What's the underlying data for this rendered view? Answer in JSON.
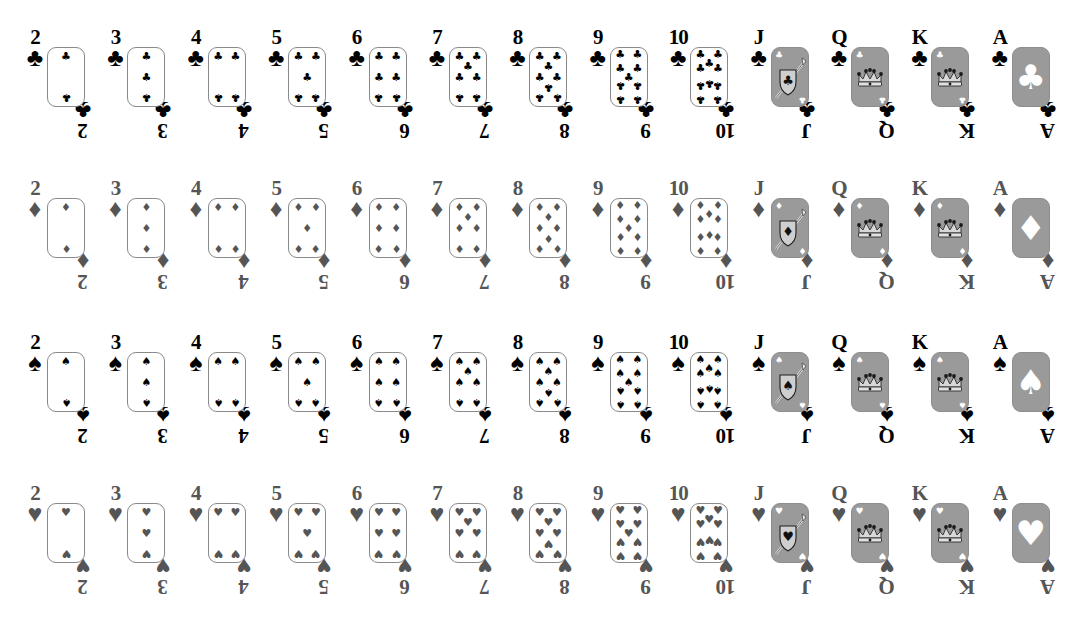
{
  "page": {
    "background": "#ffffff",
    "width": 1092,
    "height": 631
  },
  "palette": {
    "dark_suit": "#000000",
    "light_suit": "#555555",
    "card_outline": "#8a8a8a",
    "face_card_fill": "#9a9a9a",
    "card_face_white": "#ffffff"
  },
  "ranks": [
    {
      "label": "2",
      "value": 2,
      "kind": "number"
    },
    {
      "label": "3",
      "value": 3,
      "kind": "number"
    },
    {
      "label": "4",
      "value": 4,
      "kind": "number"
    },
    {
      "label": "5",
      "value": 5,
      "kind": "number"
    },
    {
      "label": "6",
      "value": 6,
      "kind": "number"
    },
    {
      "label": "7",
      "value": 7,
      "kind": "number"
    },
    {
      "label": "8",
      "value": 8,
      "kind": "number"
    },
    {
      "label": "9",
      "value": 9,
      "kind": "number"
    },
    {
      "label": "10",
      "value": 10,
      "kind": "number"
    },
    {
      "label": "J",
      "value": 11,
      "kind": "jack"
    },
    {
      "label": "Q",
      "value": 12,
      "kind": "queen"
    },
    {
      "label": "K",
      "value": 13,
      "kind": "king"
    },
    {
      "label": "A",
      "value": 1,
      "kind": "ace"
    }
  ],
  "suits": [
    {
      "name": "clubs",
      "glyph": "♣",
      "color": "#000000",
      "tone": "dark",
      "row": 0,
      "top": 25
    },
    {
      "name": "diamonds",
      "glyph": "♦",
      "color": "#555555",
      "tone": "gray",
      "row": 1,
      "top": 176
    },
    {
      "name": "spades",
      "glyph": "♠",
      "color": "#000000",
      "tone": "dark",
      "row": 2,
      "top": 330
    },
    {
      "name": "hearts",
      "glyph": "♥",
      "color": "#555555",
      "tone": "gray",
      "row": 3,
      "top": 481
    }
  ],
  "layout": {
    "column_start_x": 18,
    "column_step_x": 80.4,
    "card_body_width": 38,
    "card_body_height": 60
  },
  "pip_layouts": {
    "2": [
      [
        50,
        14
      ],
      [
        50,
        86
      ]
    ],
    "3": [
      [
        50,
        14
      ],
      [
        50,
        50
      ],
      [
        50,
        86
      ]
    ],
    "4": [
      [
        26,
        14
      ],
      [
        74,
        14
      ],
      [
        26,
        86
      ],
      [
        74,
        86
      ]
    ],
    "5": [
      [
        26,
        14
      ],
      [
        74,
        14
      ],
      [
        50,
        50
      ],
      [
        26,
        86
      ],
      [
        74,
        86
      ]
    ],
    "6": [
      [
        26,
        14
      ],
      [
        74,
        14
      ],
      [
        26,
        50
      ],
      [
        74,
        50
      ],
      [
        26,
        86
      ],
      [
        74,
        86
      ]
    ],
    "7": [
      [
        26,
        14
      ],
      [
        74,
        14
      ],
      [
        50,
        32
      ],
      [
        26,
        50
      ],
      [
        74,
        50
      ],
      [
        26,
        86
      ],
      [
        74,
        86
      ]
    ],
    "8": [
      [
        26,
        14
      ],
      [
        74,
        14
      ],
      [
        50,
        32
      ],
      [
        26,
        50
      ],
      [
        74,
        50
      ],
      [
        50,
        68
      ],
      [
        26,
        86
      ],
      [
        74,
        86
      ]
    ],
    "9": [
      [
        26,
        12
      ],
      [
        74,
        12
      ],
      [
        26,
        36
      ],
      [
        74,
        36
      ],
      [
        50,
        50
      ],
      [
        26,
        64
      ],
      [
        74,
        64
      ],
      [
        26,
        88
      ],
      [
        74,
        88
      ]
    ],
    "10": [
      [
        26,
        12
      ],
      [
        74,
        12
      ],
      [
        50,
        26
      ],
      [
        26,
        36
      ],
      [
        74,
        36
      ],
      [
        50,
        62
      ],
      [
        26,
        64
      ],
      [
        74,
        64
      ],
      [
        26,
        88
      ],
      [
        74,
        88
      ]
    ]
  },
  "face_art": {
    "jack": {
      "motif": "shield-and-lance",
      "description": "diagonal lance over shield bearing suit symbol"
    },
    "queen": {
      "motif": "crown",
      "description": "crown with suit-tipped points"
    },
    "king": {
      "motif": "crown",
      "description": "crown with suit-tipped points"
    },
    "ace": {
      "motif": "large-suit",
      "description": "single large suit symbol filling the card"
    }
  },
  "legend": {
    "note": "Standard 52-card deck laid out 13 ranks across, 4 suits down"
  }
}
